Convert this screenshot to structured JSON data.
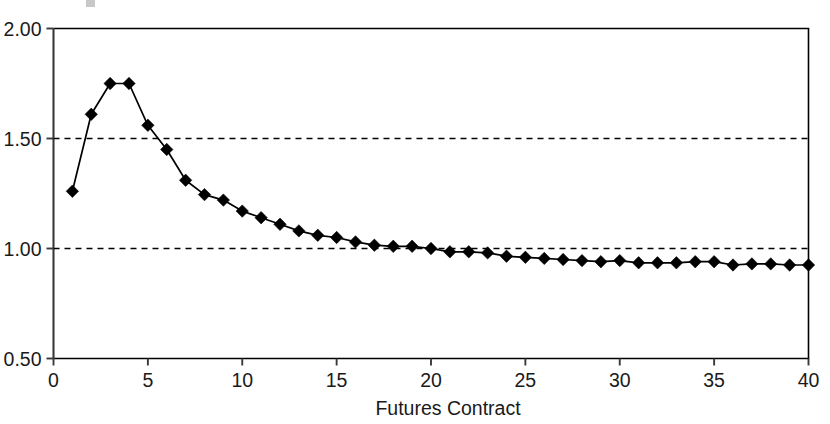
{
  "chart_data": {
    "type": "line",
    "title": "",
    "xlabel": "Futures Contract",
    "ylabel": "",
    "xlim": [
      0,
      40
    ],
    "ylim": [
      0.5,
      2.0
    ],
    "xticks": [
      0,
      5,
      10,
      15,
      20,
      25,
      30,
      35,
      40
    ],
    "xtick_labels": [
      "0",
      "5",
      "10",
      "15",
      "20",
      "25",
      "30",
      "35",
      "40"
    ],
    "yticks": [
      0.5,
      1.0,
      1.5,
      2.0
    ],
    "ytick_labels": [
      "0.50",
      "1.00",
      "1.50",
      "2.00"
    ],
    "gridlines_y": [
      1.0,
      1.5
    ],
    "grid": "horizontal-dashed",
    "legend": "none",
    "marker": "diamond",
    "line_color": "#000000",
    "marker_color": "#000000",
    "x": [
      1,
      2,
      3,
      4,
      5,
      6,
      7,
      8,
      9,
      10,
      11,
      12,
      13,
      14,
      15,
      16,
      17,
      18,
      19,
      20,
      21,
      22,
      23,
      24,
      25,
      26,
      27,
      28,
      29,
      30,
      31,
      32,
      33,
      34,
      35,
      36,
      37,
      38,
      39,
      40
    ],
    "values": [
      1.26,
      1.61,
      1.75,
      1.75,
      1.56,
      1.45,
      1.31,
      1.245,
      1.22,
      1.17,
      1.14,
      1.11,
      1.08,
      1.06,
      1.05,
      1.03,
      1.015,
      1.01,
      1.01,
      1.0,
      0.985,
      0.985,
      0.98,
      0.965,
      0.96,
      0.955,
      0.95,
      0.945,
      0.94,
      0.945,
      0.935,
      0.935,
      0.935,
      0.94,
      0.94,
      0.925,
      0.93,
      0.93,
      0.925,
      0.925
    ],
    "series": [
      {
        "name": "futures-curve",
        "values": [
          1.26,
          1.61,
          1.75,
          1.75,
          1.56,
          1.45,
          1.31,
          1.245,
          1.22,
          1.17,
          1.14,
          1.11,
          1.08,
          1.06,
          1.05,
          1.03,
          1.015,
          1.01,
          1.01,
          1.0,
          0.985,
          0.985,
          0.98,
          0.965,
          0.96,
          0.955,
          0.95,
          0.945,
          0.94,
          0.945,
          0.935,
          0.935,
          0.935,
          0.94,
          0.94,
          0.925,
          0.93,
          0.93,
          0.925,
          0.925
        ]
      }
    ]
  }
}
